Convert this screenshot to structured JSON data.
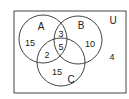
{
  "diagram": {
    "type": "venn",
    "universe_label": "U",
    "sets": [
      {
        "name": "A",
        "cx": 43,
        "cy": 39,
        "r": 24
      },
      {
        "name": "B",
        "cx": 78,
        "cy": 40,
        "r": 24
      },
      {
        "name": "C",
        "cx": 61,
        "cy": 62,
        "r": 24
      }
    ],
    "regions": {
      "A_only": "15",
      "B_only": "10",
      "C_only": "15",
      "A_and_B_only": "3",
      "A_and_C_only": "2",
      "B_and_C_only": "",
      "A_and_B_and_C": "5",
      "outside": "4"
    }
  }
}
